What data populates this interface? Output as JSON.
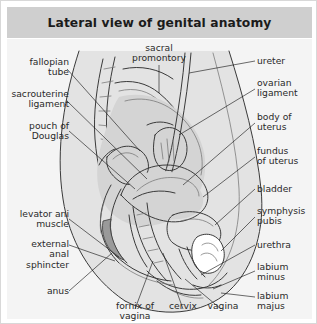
{
  "figure": {
    "title": "Lateral view of genital anatomy",
    "accent_color": "#cfcfcf",
    "canvas_color": "#f4f4f4",
    "text_color": "#2a2a2a",
    "border_color": "#d8d8d8"
  },
  "labels": {
    "fallopian_tube": "fallopian\ntube",
    "sacrouterine_ligament": "sacrouterine\nligament",
    "pouch_of_douglas": "pouch of\nDouglas",
    "levator_ani_muscle": "levator ani\nmuscle",
    "external_anal_sphincter": "external\nanal\nsphincter",
    "anus": "anus",
    "sacral_promontory": "sacral\npromontory",
    "ureter": "ureter",
    "ovarian_ligament": "ovarian\nligament",
    "body_of_uterus": "body of\nuterus",
    "fundus_of_uterus": "fundus\nof uterus",
    "bladder": "bladder",
    "symphysis_pubis": "symphysis\npubis",
    "urethra": "urethra",
    "labium_minus": "labium\nminus",
    "labium_majus": "labium\nmajus",
    "fornix_of_vagina": "fornix of\nvagina",
    "cervix": "cervix",
    "vagina": "vagina"
  }
}
